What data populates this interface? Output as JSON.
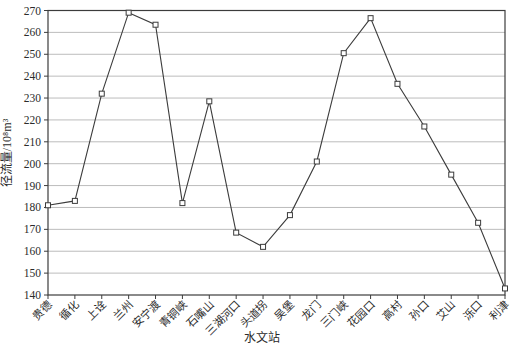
{
  "chart_data": {
    "type": "line",
    "title": "",
    "xlabel": "水文站",
    "ylabel": "径流量/10⁸m³",
    "categories": [
      "贵德",
      "循化",
      "上诠",
      "兰州",
      "安宁渡",
      "青铜峡",
      "石嘴山",
      "三湖河口",
      "头道拐",
      "吴堡",
      "龙门",
      "三门峡",
      "花园口",
      "高村",
      "孙口",
      "艾山",
      "泺口",
      "利津"
    ],
    "values": [
      181,
      183,
      232,
      269,
      263.5,
      182,
      228.5,
      168.5,
      162,
      176.5,
      201,
      250.5,
      266.5,
      236.5,
      217,
      195,
      173,
      143
    ],
    "ylim": [
      140,
      270
    ],
    "ytick_step": 10,
    "ytick_labels": [
      "140",
      "150",
      "160",
      "170",
      "180",
      "190",
      "200",
      "210",
      "220",
      "230",
      "240",
      "250",
      "260",
      "270"
    ],
    "grid": "horizontal",
    "legend": "none",
    "marker": "open-square",
    "colors": {
      "line": "#3c3c3c",
      "marker_fill": "#ffffff",
      "frame": "#3c3c3c",
      "gridline": "#bcbcbc",
      "text": "#2b2b2b",
      "background": "#ffffff"
    }
  }
}
